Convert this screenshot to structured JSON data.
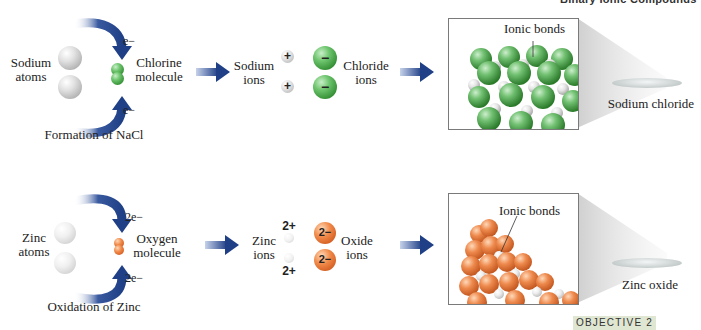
{
  "header": {
    "title": "Binary Ionic Compounds"
  },
  "rows": [
    {
      "atoms_label": [
        "Sodium",
        "atoms"
      ],
      "molecule_label": [
        "Chlorine",
        "molecule"
      ],
      "electron_top": "e−",
      "electron_bottom": "e−",
      "caption": "Formation of NaCl",
      "cation_label": [
        "Sodium",
        "ions"
      ],
      "cation_charge": "+",
      "anion_label": [
        "Chloride",
        "ions"
      ],
      "anion_charge": "−",
      "bond_label": "Ionic bonds",
      "product_label": "Sodium chloride",
      "colors": {
        "anion": "#3c9a3c",
        "cation": "#c8c8c8"
      }
    },
    {
      "atoms_label": [
        "Zinc",
        "atoms"
      ],
      "molecule_label": [
        "Oxygen",
        "molecule"
      ],
      "electron_top": "2e−",
      "electron_bottom": "2e−",
      "caption": "Oxidation of Zinc",
      "cation_label": [
        "Zinc",
        "ions"
      ],
      "cation_charge": "2+",
      "anion_label": [
        "Oxide",
        "ions"
      ],
      "anion_charge": "2−",
      "bond_label": "Ionic bonds",
      "product_label": "Zinc oxide",
      "colors": {
        "anion": "#e06a2c",
        "cation": "#ececec"
      }
    }
  ],
  "footer": {
    "objective": "OBJECTIVE 2"
  },
  "colors": {
    "arrow": "#1f3f86",
    "objective_bg": "#dfe6d2"
  },
  "icons": {
    "arrow": "right-arrow-icon",
    "electron_transfer": "curved-arrow-icon"
  }
}
